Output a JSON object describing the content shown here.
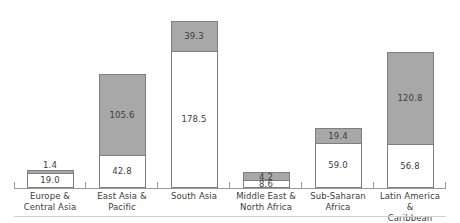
{
  "chart_data": {
    "type": "bar",
    "subtype": "stacked-column",
    "title": "",
    "subtitle": "",
    "xlabel": "",
    "ylabel": "",
    "ylim": [
      0,
      230
    ],
    "grid": false,
    "legend": null,
    "axis_visible": {
      "x": true,
      "y": false
    },
    "value_labels": true,
    "categories": [
      "Europe &\nCentral Asia",
      "East Asia &\nPacific",
      "South Asia",
      "Middle East &\nNorth Africa",
      "Sub-Saharan\nAfrica",
      "Latin America &\nCaribbean"
    ],
    "series": [
      {
        "name": "base",
        "color": "#ffffff",
        "values": [
          19.0,
          42.8,
          178.5,
          8.6,
          59.0,
          56.8
        ]
      },
      {
        "name": "top",
        "color": "#a8a8a8",
        "values": [
          1.4,
          105.6,
          39.3,
          4.2,
          19.4,
          120.8
        ]
      }
    ],
    "totals": [
      20.4,
      148.4,
      217.8,
      12.8,
      78.4,
      177.6
    ]
  },
  "bars": [
    {
      "category_line1": "Europe &",
      "category_line2": "Central Asia",
      "base_label": "19.0",
      "top_label": "1.4",
      "base_value": 19.0,
      "top_value": 1.4,
      "top_label_outside": true,
      "base_label_inside": true
    },
    {
      "category_line1": "East Asia &",
      "category_line2": "Pacific",
      "base_label": "42.8",
      "top_label": "105.6",
      "base_value": 42.8,
      "top_value": 105.6,
      "top_label_outside": false,
      "base_label_inside": true
    },
    {
      "category_line1": "South Asia",
      "category_line2": "",
      "base_label": "178.5",
      "top_label": "39.3",
      "base_value": 178.5,
      "top_value": 39.3,
      "top_label_outside": false,
      "base_label_inside": true
    },
    {
      "category_line1": "Middle East &",
      "category_line2": "North Africa",
      "base_label": "8.6",
      "top_label": "4.2",
      "base_value": 8.6,
      "top_value": 4.2,
      "top_label_outside": false,
      "base_label_inside": true
    },
    {
      "category_line1": "Sub-Saharan",
      "category_line2": "Africa",
      "base_label": "59.0",
      "top_label": "19.4",
      "base_value": 59.0,
      "top_value": 19.4,
      "top_label_outside": false,
      "base_label_inside": true
    },
    {
      "category_line1": "Latin America &",
      "category_line2": "Caribbean",
      "base_label": "56.8",
      "top_label": "120.8",
      "base_value": 56.8,
      "top_value": 120.8,
      "top_label_outside": false,
      "base_label_inside": true
    }
  ],
  "style": {
    "top_segment_color": "#a8a8a8",
    "base_segment_color": "#ffffff",
    "segment_border_color": "#7f7f7f",
    "axis_color": "#9a9a9a",
    "footer_rule_color": "#cfcfcf",
    "label_color": "#3d3d3d",
    "background": "#ffffff"
  }
}
